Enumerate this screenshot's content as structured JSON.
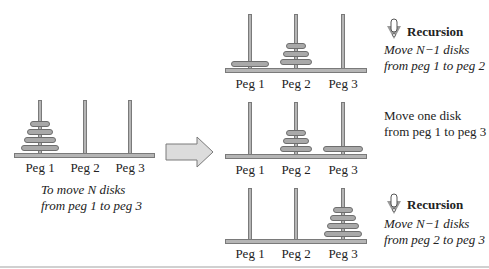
{
  "diagram": {
    "colors": {
      "disk": "#a9a9a9",
      "disk_border": "#6e6e6e",
      "peg": "#b5b5b5",
      "arrow": "#d9d9d9"
    }
  },
  "start": {
    "pegs": [
      "Peg 1",
      "Peg 2",
      "Peg 3"
    ],
    "caption_line1": "To move N disks",
    "caption_line2": "from peg 1 to peg 3",
    "disks_on_pegs": [
      4,
      0,
      0
    ]
  },
  "steps": [
    {
      "pegs": [
        "Peg 1",
        "Peg 2",
        "Peg 3"
      ],
      "badge": "Recursion",
      "line1": "Move N−1 disks",
      "line2": "from peg 1 to peg 2",
      "italic": true,
      "disks_on_pegs": [
        1,
        3,
        0
      ]
    },
    {
      "pegs": [
        "Peg 1",
        "Peg 2",
        "Peg 3"
      ],
      "badge": "",
      "line1": "Move one disk",
      "line2": "from peg 1 to peg 3",
      "italic": false,
      "disks_on_pegs": [
        0,
        3,
        1
      ]
    },
    {
      "pegs": [
        "Peg 1",
        "Peg 2",
        "Peg 3"
      ],
      "badge": "Recursion",
      "line1": "Move N−1 disks",
      "line2": "from peg 2 to peg 3",
      "italic": true,
      "disks_on_pegs": [
        0,
        0,
        4
      ]
    }
  ]
}
